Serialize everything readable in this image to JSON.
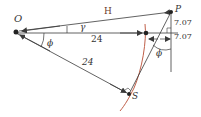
{
  "diagram": {
    "type": "geometry",
    "points": {
      "O": {
        "label": "O"
      },
      "P": {
        "label": "P"
      },
      "S": {
        "label": "S"
      }
    },
    "labels": {
      "H": "H",
      "gamma": "γ",
      "phi_left": "ϕ",
      "phi_right": "ϕ",
      "len_OP_horizontal": "24",
      "len_OS": "24",
      "offset_upper": "7.07",
      "offset_lower": "7.07"
    },
    "colors": {
      "lines": "#3a3a3a",
      "curve": "#c0604a",
      "text": "#333333"
    }
  }
}
